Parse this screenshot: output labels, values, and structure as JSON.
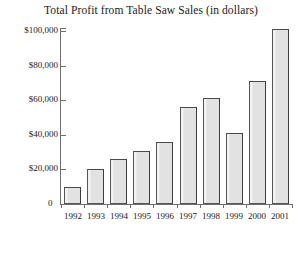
{
  "chart_data": {
    "type": "bar",
    "title": "Total Profit from Table Saw Sales (in dollars)",
    "xlabel": "",
    "ylabel": "",
    "categories": [
      "1992",
      "1993",
      "1994",
      "1995",
      "1996",
      "1997",
      "1998",
      "1999",
      "2000",
      "2001"
    ],
    "values": [
      10000,
      20500,
      26000,
      30500,
      36000,
      56000,
      61000,
      41000,
      71000,
      101000
    ],
    "ylim": [
      0,
      105000
    ],
    "ytick_values": [
      0,
      20000,
      40000,
      60000,
      80000,
      100000
    ],
    "ytick_labels": [
      "0",
      "$20,000",
      "$40,000",
      "$60,000",
      "$80,000",
      "$100,000"
    ],
    "grid": false,
    "legend": false,
    "bar_fill_color": "#e3e3e3",
    "bar_border_color": "#555555",
    "axis_color": "#6e6e6e",
    "background_color": "#ffffff"
  }
}
